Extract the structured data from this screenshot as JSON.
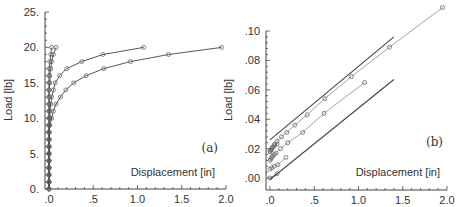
{
  "chart_data": [
    {
      "panel": "(a)",
      "type": "line",
      "xlabel": "Displacement [in]",
      "ylabel": "Load [lb]",
      "xlim": [
        0,
        2.0
      ],
      "ylim": [
        0,
        25
      ],
      "x_ticks": [
        ".0",
        ".5",
        "1.0",
        "1.5",
        "2.0"
      ],
      "y_ticks": [
        "0.",
        "5.",
        "10.",
        "15.",
        "20.",
        "25."
      ],
      "grid": false,
      "series": [
        {
          "name": "curve-1",
          "x": [
            0,
            0,
            0,
            0,
            0,
            0,
            0,
            0,
            0,
            0,
            0,
            0,
            0,
            0,
            0,
            0,
            0,
            0,
            0.01,
            0.02,
            0.03
          ],
          "y": [
            0,
            1,
            2,
            3,
            4,
            5,
            6,
            7,
            8,
            9,
            10,
            11,
            12,
            13,
            14,
            15,
            16,
            17,
            18,
            19,
            20
          ]
        },
        {
          "name": "curve-2",
          "x": [
            0,
            0,
            0,
            0,
            0,
            0,
            0,
            0,
            0,
            0,
            0,
            0,
            0,
            0,
            0,
            0.01,
            0.01,
            0.02,
            0.03,
            0.05,
            0.08
          ],
          "y": [
            0,
            1,
            2,
            3,
            4,
            5,
            6,
            7,
            8,
            9,
            10,
            11,
            12,
            13,
            14,
            15,
            16,
            17,
            18,
            19,
            20
          ]
        },
        {
          "name": "curve-3",
          "x": [
            0,
            0,
            0,
            0,
            0,
            0,
            0,
            0,
            0,
            0,
            0.01,
            0.01,
            0.02,
            0.03,
            0.05,
            0.07,
            0.12,
            0.2,
            0.37,
            0.61,
            1.07
          ],
          "y": [
            0,
            1,
            2,
            3,
            4,
            5,
            6,
            7,
            8,
            9,
            10,
            11,
            12,
            13,
            14,
            15,
            16,
            17,
            18,
            19,
            20
          ]
        },
        {
          "name": "curve-4",
          "x": [
            0,
            0,
            0,
            0,
            0,
            0,
            0,
            0,
            0,
            0.01,
            0.03,
            0.05,
            0.08,
            0.13,
            0.19,
            0.28,
            0.42,
            0.62,
            0.92,
            1.35,
            1.95
          ],
          "y": [
            0,
            1,
            2,
            3,
            4,
            5,
            6,
            7,
            8,
            9,
            10,
            11,
            12,
            13,
            14,
            15,
            16,
            17,
            18,
            19,
            20
          ]
        }
      ]
    },
    {
      "panel": "(b)",
      "type": "line",
      "xlabel": "Displacement [in]",
      "ylabel": "Load [lb]",
      "xlim": [
        0,
        2.0
      ],
      "ylim": [
        0,
        0.1
      ],
      "x_ticks": [
        ".0",
        ".5",
        "1.0",
        "1.5",
        "2.0"
      ],
      "y_ticks": [
        ".00",
        ".02",
        ".04",
        ".06",
        ".08",
        ".10"
      ],
      "grid": false,
      "series": [
        {
          "name": "shifted-1",
          "x": [
            0,
            0.01,
            0.02,
            0.03,
            0.05,
            0.08
          ],
          "y": [
            0.018,
            0.019,
            0.02,
            0.021,
            0.022,
            0.023
          ]
        },
        {
          "name": "shifted-2",
          "x": [
            0,
            0.01,
            0.02,
            0.03,
            0.05,
            0.07,
            0.12,
            0.2,
            0.37,
            0.61,
            1.07
          ],
          "y": [
            0.012,
            0.013,
            0.014,
            0.015,
            0.016,
            0.017,
            0.02,
            0.024,
            0.031,
            0.044,
            0.065
          ]
        },
        {
          "name": "shifted-3",
          "x": [
            0,
            0.01,
            0.03,
            0.05,
            0.08,
            0.13,
            0.19,
            0.28,
            0.42,
            0.62,
            0.92,
            1.35,
            1.95
          ],
          "y": [
            0.018,
            0.019,
            0.021,
            0.023,
            0.025,
            0.028,
            0.031,
            0.036,
            0.043,
            0.054,
            0.069,
            0.089,
            0.116
          ]
        },
        {
          "name": "shifted-4",
          "x": [
            0,
            0.02,
            0.05,
            0.09,
            0.18
          ],
          "y": [
            0.006,
            0.007,
            0.008,
            0.009,
            0.014
          ]
        },
        {
          "name": "shifted-5",
          "x": [
            0,
            0.08
          ],
          "y": [
            0,
            0.003
          ]
        },
        {
          "name": "reference-upper",
          "x": [
            0,
            1.4
          ],
          "y": [
            0.026,
            0.096
          ]
        },
        {
          "name": "reference-lower",
          "x": [
            0,
            1.4
          ],
          "y": [
            -0.001,
            0.067
          ]
        }
      ]
    }
  ],
  "panels": {
    "a": {
      "label": "(a)",
      "xlabel": "Displacement [in]",
      "ylabel": "Load [lb]"
    },
    "b": {
      "label": "(b)",
      "xlabel": "Displacement [in]",
      "ylabel": "Load [lb]"
    }
  },
  "colors": {
    "axis": "#444444",
    "line_dark": "#444444",
    "line_light": "#999999",
    "marker": "#666666"
  }
}
